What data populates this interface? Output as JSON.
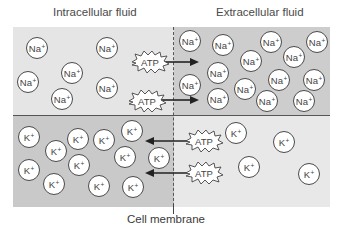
{
  "labels": {
    "intracellular": "Intracellular fluid",
    "extracellular": "Extracellular fluid",
    "membrane": "Cell membrane"
  },
  "ions": {
    "na": {
      "symbol": "Na",
      "charge": "+"
    },
    "k": {
      "symbol": "K",
      "charge": "+"
    }
  },
  "atp_label": "ATP",
  "colors": {
    "intracellular_na_region": "#e5e5e5",
    "extracellular_na_region": "#cdcdcd",
    "intracellular_k_region": "#c9c9c9",
    "extracellular_k_region": "#e8e8e8",
    "ion_fill": "#ffffff",
    "outline": "#4a4a4a"
  },
  "counts": {
    "na_intracellular": 6,
    "na_extracellular": 14,
    "k_intracellular": 12,
    "k_extracellular": 4
  }
}
